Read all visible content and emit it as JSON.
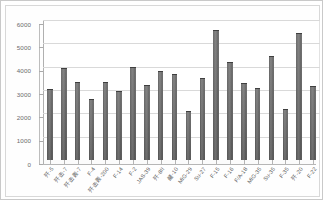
{
  "chart_data": {
    "type": "bar",
    "title": "",
    "xlabel": "",
    "ylabel": "",
    "ylim": [
      0,
      6000
    ],
    "ytick_step": 1000,
    "yticks": [
      "0",
      "1000",
      "2000",
      "3000",
      "4000",
      "5000",
      "6000"
    ],
    "grid": true,
    "legend": false,
    "orientation": "vertical",
    "bar_color": "#666666",
    "categories": [
      "歼-5",
      "歼击-7",
      "歼击轰-7",
      "F-4",
      "歼击轰-200",
      "F-14",
      "F-2",
      "JAS-39",
      "歼-8II",
      "鹾-10",
      "MiG-29",
      "Su-27",
      "F-15",
      "F-16",
      "F/A-18",
      "MiG-35",
      "Su-35",
      "F-35",
      "歼-20",
      "F-22"
    ],
    "values": [
      3020,
      3880,
      3300,
      2590,
      3300,
      2930,
      3960,
      3170,
      3770,
      3650,
      2070,
      3480,
      5510,
      4140,
      3250,
      3040,
      4420,
      2140,
      5420,
      3130
    ],
    "series": [
      {
        "name": "系列1",
        "values": [
          3020,
          3880,
          3300,
          2590,
          3300,
          2930,
          3960,
          3170,
          3770,
          3650,
          2070,
          3480,
          5510,
          4140,
          3250,
          3040,
          4420,
          2140,
          5420,
          3130
        ]
      }
    ]
  },
  "colors": {
    "bar": "#666666",
    "gridline": "#d9d9d9",
    "axis": "#b0b0b0",
    "text": "#5f5f5f",
    "chart_border": "#c9c9c9",
    "plot_background": "#ffffff"
  }
}
